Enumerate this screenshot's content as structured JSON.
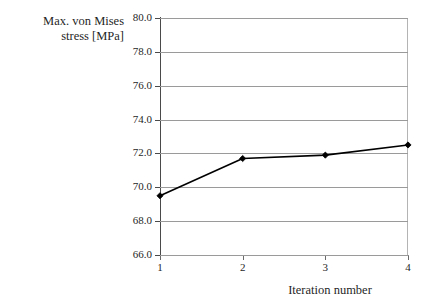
{
  "chart_data": {
    "type": "line",
    "title": "",
    "xlabel": "Iteration number",
    "ylabel": "Max. von Mises\nstress [MPa]",
    "categories": [
      "1",
      "2",
      "3",
      "4"
    ],
    "values": [
      69.5,
      71.7,
      71.9,
      72.5
    ],
    "series": [
      {
        "name": "Max. von Mises stress",
        "values": [
          69.5,
          71.7,
          71.9,
          72.5
        ]
      }
    ],
    "ylim": [
      66.0,
      80.0
    ],
    "ytick_step": 2.0,
    "yticks": [
      "66.0",
      "68.0",
      "70.0",
      "72.0",
      "74.0",
      "76.0",
      "78.0",
      "80.0"
    ],
    "xticks": [
      "1",
      "2",
      "3",
      "4"
    ],
    "grid": "horizontal",
    "legend": "none",
    "marker": "diamond",
    "line_color": "#000000",
    "grid_color": "#9a9a9a",
    "background_color": "#ffffff"
  },
  "axes": {
    "y_title": "Max. von Mises\nstress [MPa]",
    "x_title": "Iteration number"
  }
}
